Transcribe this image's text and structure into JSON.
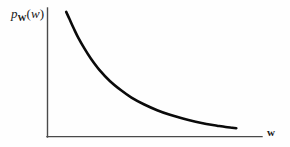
{
  "figure": {
    "background_color": "#fefefe",
    "axis_color": "#4a4a4a",
    "curve_color": "#0a0a0a",
    "y_axis_label": {
      "symbol": "p",
      "subscript": "W",
      "open_paren": "(",
      "argument": "w",
      "close_paren": ")",
      "full_text": "p_W(w)"
    },
    "x_axis_label": "w"
  },
  "chart_data": {
    "type": "line",
    "title": "",
    "xlabel": "w",
    "ylabel": "p_W(w)",
    "grid": false,
    "legend": null,
    "xlim": [
      0,
      1
    ],
    "ylim": [
      0,
      1
    ],
    "axes_style": "open L-shaped axes, no tick marks, no tick labels",
    "annotations": [],
    "series": [
      {
        "name": "p_W(w)",
        "description": "Monotonically decreasing probability density, steep near the origin and flattening toward zero at large w",
        "x": [
          0.085,
          0.1,
          0.12,
          0.14,
          0.17,
          0.2,
          0.24,
          0.29,
          0.34,
          0.39,
          0.45,
          0.51,
          0.57,
          0.63,
          0.69,
          0.74,
          0.79,
          0.83,
          0.86,
          0.88
        ],
        "y": [
          0.985,
          0.93,
          0.855,
          0.785,
          0.695,
          0.615,
          0.525,
          0.435,
          0.365,
          0.305,
          0.25,
          0.205,
          0.168,
          0.138,
          0.113,
          0.095,
          0.082,
          0.072,
          0.066,
          0.062
        ]
      }
    ]
  }
}
